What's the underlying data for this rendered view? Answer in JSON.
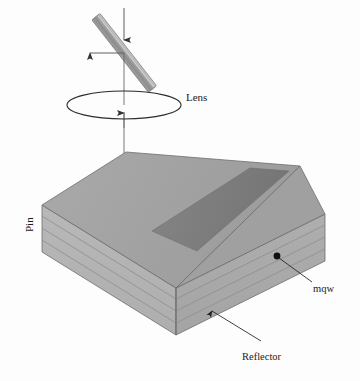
{
  "figure": {
    "background_color": "#fdfdfd"
  },
  "labels": {
    "lens": "Lens",
    "pin": "Pin",
    "mqw": "mqw",
    "reflector": "Reflector"
  },
  "colors": {
    "top_face": "#a3a3a3",
    "top_face_stripe": "#7d7d7d",
    "left_face": "#b3b3b3",
    "right_face": "#a8a8a8",
    "layer_line": "#8a8a8a",
    "outline": "#5a5a5a",
    "beamsplitter_light": "#c8c8c8",
    "beamsplitter_mid": "#9a9a9a",
    "beamsplitter_dark": "#7a7a7a",
    "arrow": "#3a3a3a",
    "lens_outline": "#2a2a2a",
    "text": "#1a1a1a",
    "dot": "#111111"
  },
  "optics": {
    "beam_vertical_x": 124,
    "beam_top_y": 8,
    "beam_bottom_y": 196,
    "beamsplitter_angle_deg": 52,
    "reflected_beam_y": 53,
    "reflected_beam_end_x": 82,
    "lens_center_x": 124,
    "lens_center_y": 105,
    "lens_rx": 57,
    "lens_ry": 14
  },
  "slab": {
    "layer_count": 4,
    "stripe_name": "mqw-stripe",
    "top_vertices": "42,205 126,152 300,166 216,231",
    "description": "Layered parallelepiped slab with dark mqw stripe on top face"
  }
}
